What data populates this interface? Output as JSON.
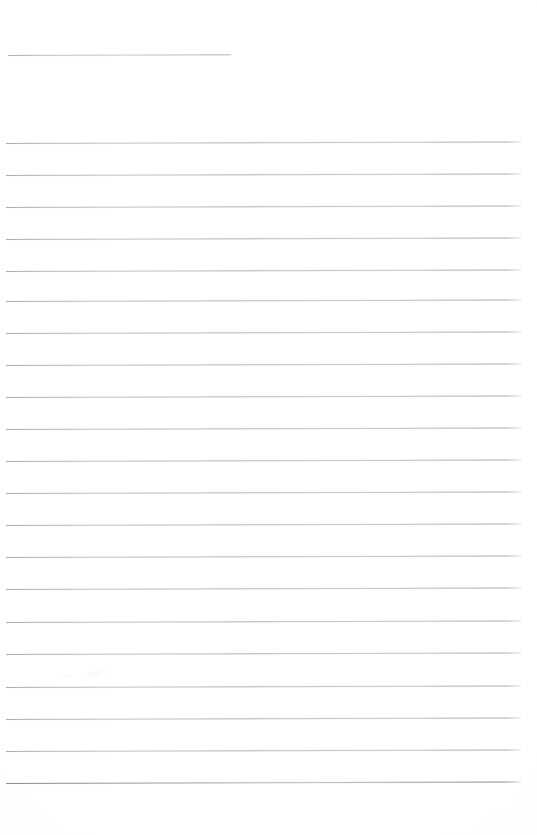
{
  "document": {
    "kind": "scanned-lined-paper",
    "title": "Blank Ruled Notebook Page",
    "page_width": 537,
    "page_height": 835,
    "background_color": "#ffffff",
    "rule_color": "#a8aab0",
    "rule_color_dark": "#7a7c84",
    "content_text": "",
    "handwriting_present": "none",
    "printed_text_present": "none",
    "orientation": "portrait"
  },
  "layout": {
    "rule_left_x": 6,
    "rule_right_x": 520,
    "rule_thickness": 1,
    "rule_spacing": 32,
    "top_margin": 55,
    "bottom_margin": 52,
    "tilt_degrees": -0.16
  },
  "header_rule": {
    "label": "header-short-rule",
    "y": 55,
    "x_start": 8,
    "x_end": 232,
    "length": 224
  },
  "body_rules": [
    {
      "index": 1,
      "y": 143,
      "x_start": 6,
      "x_end": 521
    },
    {
      "index": 2,
      "y": 175,
      "x_start": 6,
      "x_end": 521
    },
    {
      "index": 3,
      "y": 207,
      "x_start": 6,
      "x_end": 521
    },
    {
      "index": 4,
      "y": 239,
      "x_start": 6,
      "x_end": 521
    },
    {
      "index": 5,
      "y": 271,
      "x_start": 6,
      "x_end": 521
    },
    {
      "index": 6,
      "y": 301,
      "x_start": 6,
      "x_end": 521
    },
    {
      "index": 7,
      "y": 333,
      "x_start": 6,
      "x_end": 521
    },
    {
      "index": 8,
      "y": 365,
      "x_start": 6,
      "x_end": 521
    },
    {
      "index": 9,
      "y": 397,
      "x_start": 6,
      "x_end": 521
    },
    {
      "index": 10,
      "y": 429,
      "x_start": 6,
      "x_end": 521
    },
    {
      "index": 11,
      "y": 461,
      "x_start": 6,
      "x_end": 521
    },
    {
      "index": 12,
      "y": 493,
      "x_start": 6,
      "x_end": 521
    },
    {
      "index": 13,
      "y": 525,
      "x_start": 6,
      "x_end": 521
    },
    {
      "index": 14,
      "y": 557,
      "x_start": 6,
      "x_end": 521
    },
    {
      "index": 15,
      "y": 589,
      "x_start": 6,
      "x_end": 521
    },
    {
      "index": 16,
      "y": 622,
      "x_start": 6,
      "x_end": 521
    },
    {
      "index": 17,
      "y": 654,
      "x_start": 6,
      "x_end": 521
    },
    {
      "index": 18,
      "y": 687,
      "x_start": 6,
      "x_end": 521
    },
    {
      "index": 19,
      "y": 719,
      "x_start": 6,
      "x_end": 521
    },
    {
      "index": 20,
      "y": 751,
      "x_start": 6,
      "x_end": 521
    },
    {
      "index": 21,
      "y": 783,
      "x_start": 6,
      "x_end": 521,
      "emphasis": "dark"
    }
  ],
  "artifacts": [
    {
      "label": "scan-smudge",
      "x": 86,
      "y": 672,
      "w": 14,
      "h": 4,
      "opacity": 0.09
    },
    {
      "label": "scan-smudge",
      "x": 99,
      "y": 670,
      "w": 9,
      "h": 3,
      "opacity": 0.07
    },
    {
      "label": "scan-smudge",
      "x": 60,
      "y": 674,
      "w": 11,
      "h": 3,
      "opacity": 0.06
    }
  ]
}
